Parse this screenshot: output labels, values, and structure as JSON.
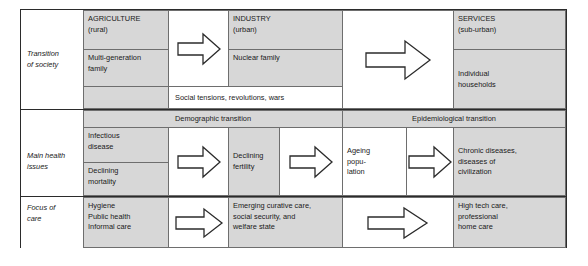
{
  "diagram": {
    "colors": {
      "shade": "#d7d7d7",
      "white": "#ffffff",
      "border_outer": "#2b2b2b",
      "border_inner": "#6e6e6e",
      "text": "#1a1a1a"
    },
    "row_labels": {
      "society": "Transition\nof society",
      "health": "Main health\nissues",
      "care": "Focus of\ncare"
    },
    "society": {
      "stage1_top": "AGRICULTURE\n(rural)",
      "stage1_bottom": "Multi-generation\nfamily",
      "stage2_top": "INDUSTRY\n(urban)",
      "stage2_bottom": "Nuclear family",
      "stage3_top": "SERVICES\n(sub-urban)",
      "stage3_bottom": "Individual\nhouseholds",
      "social_note": "Social tensions, revolutions, wars",
      "arrow1": "right-arrow-icon",
      "arrow2": "right-arrow-icon"
    },
    "bands": {
      "demographic": "Demographic transition",
      "epidemiological": "Epidemiological transition"
    },
    "health": {
      "item1_top": "Infectious\ndisease",
      "item1_bottom": "Declining\nmortality",
      "item2": "Declining\nfertility",
      "item3": "Ageing\npopu-\nlation",
      "item4": "Chronic diseases,\ndiseases of\ncivilization",
      "arrow1": "right-arrow-icon",
      "arrow2": "right-arrow-icon",
      "arrow3": "right-arrow-icon"
    },
    "care": {
      "item1": "Hygiene\nPublic health\nInformal care",
      "item2": "Emerging curative care,\nsocial security, and\nwelfare state",
      "item3": "High tech care,\nprofessional\nhome care",
      "arrow1": "right-arrow-icon",
      "arrow2": "right-arrow-icon"
    }
  }
}
